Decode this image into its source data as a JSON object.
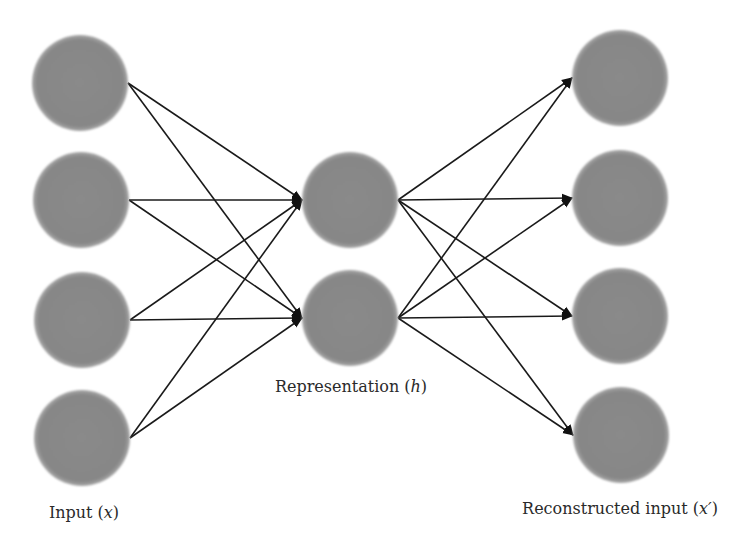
{
  "diagram": {
    "type": "autoencoder-network",
    "colors": {
      "node_fill": "#8a8a8a",
      "node_edge": "#9a9a9a",
      "edge": "#1a1a1a",
      "background": "#ffffff",
      "text": "#2a2a2a"
    },
    "node_radius": 48,
    "layers": [
      {
        "name": "input",
        "label": "Input (x)",
        "label_prefix": "Input (",
        "label_var": "x",
        "label_suffix": ")",
        "label_pos": [
          84,
          512
        ],
        "nodes": [
          [
            80,
            83
          ],
          [
            81,
            200
          ],
          [
            82,
            320
          ],
          [
            82,
            438
          ]
        ],
        "out_anchor_dx": 48
      },
      {
        "name": "representation",
        "label": "Representation (h)",
        "label_prefix": "Representation (",
        "label_var": "h",
        "label_suffix": ")",
        "label_pos": [
          351,
          386
        ],
        "nodes": [
          [
            350,
            200
          ],
          [
            350,
            318
          ]
        ],
        "in_anchor_dx": -48,
        "out_anchor_dx": 48
      },
      {
        "name": "reconstructed",
        "label": "Reconstructed input (x′)",
        "label_prefix": "Reconstructed input (",
        "label_var": "x′",
        "label_suffix": ")",
        "label_pos": [
          620,
          508
        ],
        "nodes": [
          [
            620,
            78
          ],
          [
            620,
            198
          ],
          [
            620,
            316
          ],
          [
            621,
            435
          ]
        ],
        "in_anchor_dx": -48
      }
    ],
    "edges_note": "fully connected input→representation and representation→reconstructed, arrowheads at target"
  }
}
